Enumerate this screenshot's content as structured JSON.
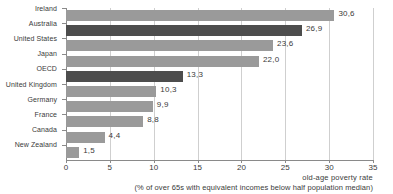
{
  "chart_data": {
    "type": "bar",
    "orientation": "horizontal",
    "title": "",
    "xlabel": "old-age poverty rate",
    "xlabel_sub": "(% of over 65s with equivalent incomes below half population median)",
    "ylabel": "",
    "xlim": [
      0,
      35
    ],
    "grid": true,
    "legend": "none",
    "decimal_separator": ",",
    "categories": [
      "Ireland",
      "Australia",
      "United States",
      "Japan",
      "OECD",
      "United Kingdom",
      "Germany",
      "France",
      "Canada",
      "New Zealand"
    ],
    "values": [
      30.6,
      26.9,
      23.6,
      22.0,
      13.3,
      10.3,
      9.9,
      8.8,
      4.4,
      1.5
    ],
    "value_labels": [
      "30,6",
      "26,9",
      "23,6",
      "22,0",
      "13,3",
      "10,3",
      "9,9",
      "8,8",
      "4,4",
      "1,5"
    ],
    "highlighted": [
      "Australia",
      "OECD"
    ],
    "xticks": [
      0,
      5,
      10,
      15,
      20,
      25,
      30,
      35
    ],
    "xtick_labels": [
      "0",
      "5",
      "10",
      "15",
      "20",
      "25",
      "30",
      "35"
    ],
    "colors": {
      "bar": "#9a9a9a",
      "bar_highlight": "#4d4d4d",
      "grid": "#cfcfcf",
      "axis": "#8a8a8a",
      "text": "#3a3a3a",
      "background": "#ffffff"
    }
  }
}
